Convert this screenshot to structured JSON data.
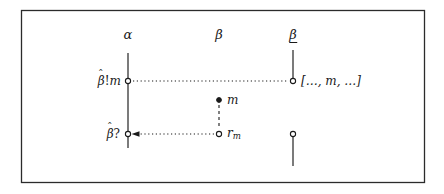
{
  "figure": {
    "frame": {
      "x": 21,
      "y": 10,
      "width": 403,
      "height": 172,
      "border_color": "#2b2b2b"
    },
    "background": "#ffffff",
    "ink_color": "#1a1a1a"
  },
  "lifelines": [
    {
      "id": "alpha",
      "label": "α",
      "label_underlined": false,
      "x": 128,
      "label_y": 36,
      "segments": [
        {
          "y1": 53,
          "y2": 148
        }
      ]
    },
    {
      "id": "beta",
      "label": "β",
      "label_underlined": false,
      "x": 219,
      "label_y": 36,
      "segments": []
    },
    {
      "id": "beta-underlined",
      "label": "β",
      "label_underlined": true,
      "x": 293,
      "label_y": 36,
      "segments": [
        {
          "y1": 50,
          "y2": 82
        },
        {
          "y1": 137,
          "y2": 166
        }
      ]
    }
  ],
  "events": [
    {
      "id": "send-event",
      "marker": "open-circle",
      "x": 128,
      "y": 81,
      "label": "β̂!m",
      "label_side": "left"
    },
    {
      "id": "receive-event",
      "marker": "open-circle",
      "x": 293,
      "y": 81,
      "label": "[…, m, …]",
      "label_side": "right"
    },
    {
      "id": "message-value",
      "marker": "filled-dot",
      "x": 219,
      "y": 100,
      "label": "m",
      "label_side": "right"
    },
    {
      "id": "reply-value",
      "marker": "open-circle",
      "x": 219,
      "y": 134,
      "label": "r",
      "label_subscript": "m",
      "label_side": "right"
    },
    {
      "id": "receive-reply-event",
      "marker": "open-circle",
      "x": 128,
      "y": 134,
      "label": "β̂?",
      "label_side": "left"
    },
    {
      "id": "queue-event",
      "marker": "open-circle",
      "x": 293,
      "y": 134,
      "label": "",
      "label_side": "none"
    }
  ],
  "connections": [
    {
      "id": "send-to-queue",
      "style": "dotted",
      "from_x": 132,
      "from_y": 81,
      "to_x": 289,
      "to_y": 81,
      "arrowhead": "none"
    },
    {
      "id": "message-to-reply",
      "style": "dashed",
      "from_x": 219,
      "from_y": 104,
      "to_x": 219,
      "to_y": 130,
      "arrowhead": "none"
    },
    {
      "id": "reply-to-receive",
      "style": "dotted",
      "from_x": 215,
      "from_y": 134,
      "to_x": 133,
      "to_y": 134,
      "arrowhead": "left"
    }
  ],
  "labels": {
    "alpha_head": "α",
    "beta_head": "β",
    "beta_underlined_head": "β",
    "send": "β̂!m",
    "receive_queue": "[…, m, …]",
    "message": "m",
    "reply_base": "r",
    "reply_sub": "m",
    "receive": "β̂?",
    "hat_glyph": "ˆ",
    "bang": "!",
    "question": "?",
    "beta_glyph": "β",
    "m_glyph": "m"
  }
}
